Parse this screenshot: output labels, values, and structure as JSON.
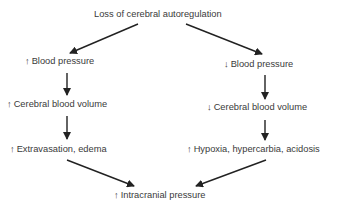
{
  "diagram": {
    "title": "Loss of cerebral autoregulation",
    "left_branch": {
      "level1": {
        "arrow": "↑",
        "label": "Blood pressure"
      },
      "level2": {
        "arrow": "↑",
        "label": "Cerebral blood volume"
      },
      "level3": {
        "arrow": "↑",
        "label": "Extravasation, edema"
      }
    },
    "right_branch": {
      "level1": {
        "arrow": "↓",
        "label": "Blood pressure"
      },
      "level2": {
        "arrow": "↓",
        "label": "Cerebral blood volume"
      },
      "level3": {
        "arrow": "↑",
        "label": "Hypoxia, hypercarbia, acidosis"
      }
    },
    "outcome": {
      "arrow": "↑",
      "label": "Intracranial pressure"
    },
    "colors": {
      "text": "#3a3a3a",
      "arrow": "#222222",
      "background": "#ffffff"
    }
  }
}
